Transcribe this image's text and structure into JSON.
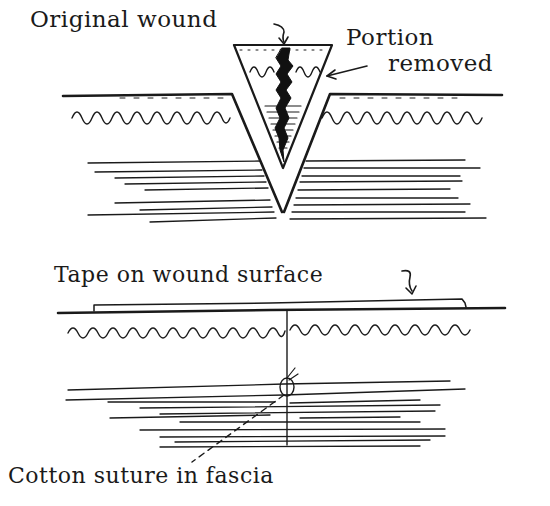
{
  "diagram": {
    "top_figure": {
      "description": "V-shaped excision of original wound through skin layers",
      "labels": {
        "original_wound": "Original wound",
        "portion_removed_line1": "Portion",
        "portion_removed_line2": "removed"
      }
    },
    "bottom_figure": {
      "description": "Closed wound with tape on surface and cotton suture in fascia",
      "labels": {
        "tape": "Tape on wound surface",
        "suture": "Cotton suture in fascia"
      }
    },
    "colors": {
      "ink": "#1a1a1a",
      "background": "#ffffff"
    }
  }
}
